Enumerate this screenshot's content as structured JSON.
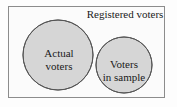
{
  "figure": {
    "type": "venn-diagram",
    "universe": {
      "label": "Registered voters",
      "shape": "rectangle",
      "border_color": "#8c8c8c",
      "fill_color": "#fbfbfb"
    },
    "sets": [
      {
        "id": "actual-voters",
        "label_line1": "Actual",
        "label_line2": "voters",
        "fill_color": "#d6d6d6",
        "stroke_color": "#555555",
        "cx": 58,
        "cy": 55,
        "r": 35
      },
      {
        "id": "voters-in-sample",
        "label_line1": "Voters",
        "label_line2": "in sample",
        "fill_color": "#d6d6d6",
        "stroke_color": "#555555",
        "cx": 124,
        "cy": 65,
        "r": 28
      }
    ],
    "intersection": {
      "fill_color": "#aaaaaa",
      "label": ""
    },
    "background_color": "#fdfdfd"
  }
}
